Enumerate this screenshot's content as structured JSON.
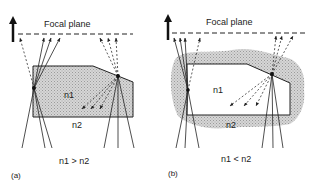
{
  "panels": [
    {
      "id": "a",
      "label": "(a)",
      "focal_plane_label": "Focal plane",
      "inner_medium": "n1",
      "outer_medium": "n2",
      "relation": "n1 > n2",
      "inner_fill": "#c8c8c8",
      "outer_fill": "#ffffff"
    },
    {
      "id": "b",
      "label": "(b)",
      "focal_plane_label": "Focal plane",
      "inner_medium": "n1",
      "outer_medium": "n2",
      "relation": "n1 < n2",
      "inner_fill": "#ffffff",
      "outer_fill": "#c4c4c4"
    }
  ],
  "colors": {
    "line": "#222222",
    "dashed": "#333333"
  }
}
